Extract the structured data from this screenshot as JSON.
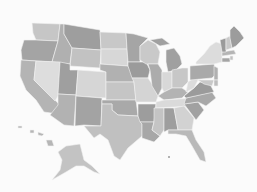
{
  "map": {
    "title": "",
    "type": "choropleth",
    "region": "United States",
    "colors": {
      "background": "#fbfbfb",
      "border": "#f2f2f2",
      "shade_light": "#d9d9d9",
      "shade_mid_light": "#c4c4c4",
      "shade_mid": "#b3b3b3",
      "shade_dark": "#9c9c9c"
    },
    "states": [
      {
        "id": "WA",
        "name": "Washington",
        "shade": "#c6c6c6",
        "d": "M32,23 L60,24 L58,41 L36,40 L33,33 Z"
      },
      {
        "id": "OR",
        "name": "Oregon",
        "shade": "#a4a4a4",
        "d": "M24,40 L36,40 L58,41 L56,48 L52,62 L22,60 L21,50 Z"
      },
      {
        "id": "CA",
        "name": "California",
        "shade": "#b4b4b4",
        "d": "M21,60 L36,61 L34,80 L60,105 L58,114 L44,112 L36,100 L26,90 L20,76 Z"
      },
      {
        "id": "ID",
        "name": "Idaho",
        "shade": "#b0b0b0",
        "d": "M60,24 L64,24 L64,34 L72,48 L70,64 L52,62 L56,48 L58,41 Z"
      },
      {
        "id": "NV",
        "name": "Nevada",
        "shade": "#dddddd",
        "d": "M36,61 L60,62 L58,96 L55,101 L34,80 Z"
      },
      {
        "id": "MT",
        "name": "Montana",
        "shade": "#9e9e9e",
        "d": "M64,24 L100,30 L101,50 L72,48 L64,34 Z"
      },
      {
        "id": "WY",
        "name": "Wyoming",
        "shade": "#c2c2c2",
        "d": "M72,48 L101,50 L100,68 L70,66 Z"
      },
      {
        "id": "UT",
        "name": "Utah",
        "shade": "#9f9f9f",
        "d": "M60,62 L70,64 L70,70 L78,70 L76,95 L58,94 Z"
      },
      {
        "id": "AZ",
        "name": "Arizona",
        "shade": "#b2b2b2",
        "d": "M58,94 L76,95 L74,126 L64,125 L50,115 L58,105 Z"
      },
      {
        "id": "CO",
        "name": "Colorado",
        "shade": "#d6d6d6",
        "d": "M78,70 L106,72 L106,98 L76,96 Z"
      },
      {
        "id": "NM",
        "name": "New Mexico",
        "shade": "#a3a3a3",
        "d": "M76,96 L102,98 L101,126 L84,125 L75,126 Z"
      },
      {
        "id": "ND",
        "name": "North Dakota",
        "shade": "#c8c8c8",
        "d": "M100,32 L126,33 L127,49 L101,49 Z"
      },
      {
        "id": "SD",
        "name": "South Dakota",
        "shade": "#d7d7d7",
        "d": "M101,49 L127,49 L128,66 L101,64 Z"
      },
      {
        "id": "NE",
        "name": "Nebraska",
        "shade": "#b1b1b1",
        "d": "M100,64 L128,66 L132,74 L134,82 L106,82 L106,72 L100,70 Z"
      },
      {
        "id": "KS",
        "name": "Kansas",
        "shade": "#c5c5c5",
        "d": "M106,82 L134,82 L136,100 L106,100 Z"
      },
      {
        "id": "OK",
        "name": "Oklahoma",
        "shade": "#a9a9a9",
        "d": "M102,100 L136,100 L138,116 L118,115 L112,110 L112,104 L102,104 Z"
      },
      {
        "id": "TX",
        "name": "Texas",
        "shade": "#c0c0c0",
        "d": "M102,104 L112,104 L112,110 L118,115 L138,116 L142,124 L142,136 L128,148 L120,160 L114,156 L108,140 L100,134 L94,138 L84,126 L101,126 Z"
      },
      {
        "id": "MN",
        "name": "Minnesota",
        "shade": "#a5a5a5",
        "d": "M126,33 L134,34 L148,38 L140,46 L140,62 L128,62 L127,49 Z"
      },
      {
        "id": "IA",
        "name": "Iowa",
        "shade": "#9b9b9b",
        "d": "M128,62 L146,62 L150,70 L148,78 L132,78 L128,66 Z"
      },
      {
        "id": "MO",
        "name": "Missouri",
        "shade": "#d4d4d4",
        "d": "M132,78 L148,78 L152,84 L158,96 L156,102 L136,102 L134,82 Z"
      },
      {
        "id": "AR",
        "name": "Arkansas",
        "shade": "#9d9d9d",
        "d": "M138,104 L156,104 L154,122 L140,122 L138,116 Z"
      },
      {
        "id": "LA",
        "name": "Louisiana",
        "shade": "#a7a7a7",
        "d": "M140,122 L154,122 L152,130 L160,136 L154,142 L142,138 L142,124 Z"
      },
      {
        "id": "WI",
        "name": "Wisconsin",
        "shade": "#c9c9c9",
        "d": "M140,46 L148,40 L156,44 L160,52 L158,64 L146,64 L140,60 Z"
      },
      {
        "id": "IL",
        "name": "Illinois",
        "shade": "#acacac",
        "d": "M148,64 L158,64 L162,70 L162,88 L158,96 L152,86 L150,70 Z"
      },
      {
        "id": "MI",
        "name": "Michigan",
        "shade": "#a0a0a0",
        "d": "M166,50 L174,48 L180,56 L182,64 L176,70 L168,72 L166,62 Z M150,40 L162,38 L170,44 L160,46 Z"
      },
      {
        "id": "IN",
        "name": "Indiana",
        "shade": "#d8d8d8",
        "d": "M162,72 L172,72 L172,88 L164,92 L162,88 Z"
      },
      {
        "id": "OH",
        "name": "Ohio",
        "shade": "#c7c7c7",
        "d": "M172,70 L182,68 L188,68 L188,82 L182,88 L172,88 Z"
      },
      {
        "id": "KY",
        "name": "Kentucky",
        "shade": "#b3b3b3",
        "d": "M158,96 L164,92 L172,88 L182,88 L188,92 L182,98 L164,100 Z"
      },
      {
        "id": "TN",
        "name": "Tennessee",
        "shade": "#dadada",
        "d": "M156,102 L164,100 L194,98 L192,106 L156,108 Z"
      },
      {
        "id": "MS",
        "name": "Mississippi",
        "shade": "#c4c4c4",
        "d": "M154,108 L164,108 L164,130 L160,136 L152,130 L154,122 Z"
      },
      {
        "id": "AL",
        "name": "Alabama",
        "shade": "#9e9e9e",
        "d": "M164,108 L174,108 L178,130 L168,130 L164,132 Z"
      },
      {
        "id": "GA",
        "name": "Georgia",
        "shade": "#d2d2d2",
        "d": "M174,108 L184,106 L194,118 L192,130 L178,130 Z"
      },
      {
        "id": "FL",
        "name": "Florida",
        "shade": "#b9b9b9",
        "d": "M168,130 L192,130 L196,140 L204,152 L206,162 L200,160 L192,146 L186,136 L176,134 L168,134 Z"
      },
      {
        "id": "SC",
        "name": "South Carolina",
        "shade": "#a1a1a1",
        "d": "M184,104 L198,102 L204,110 L196,120 Z"
      },
      {
        "id": "NC",
        "name": "North Carolina",
        "shade": "#a8a8a8",
        "d": "M186,98 L212,92 L216,98 L206,106 L198,102 L184,104 Z"
      },
      {
        "id": "VA",
        "name": "Virginia",
        "shade": "#9b9b9b",
        "d": "M184,96 L194,88 L200,82 L210,84 L214,92 L186,98 Z"
      },
      {
        "id": "WV",
        "name": "West Virginia",
        "shade": "#dcdcdc",
        "d": "M188,82 L194,78 L198,80 L194,88 L186,92 Z"
      },
      {
        "id": "PA",
        "name": "Pennsylvania",
        "shade": "#a9a9a9",
        "d": "M190,66 L214,64 L216,74 L212,78 L190,80 Z"
      },
      {
        "id": "NY",
        "name": "New York",
        "shade": "#dcdcdc",
        "d": "M196,62 L204,54 L210,46 L216,42 L222,44 L222,62 L214,64 L196,64 Z"
      },
      {
        "id": "NJ",
        "name": "New Jersey",
        "shade": "#b0b0b0",
        "d": "M214,66 L218,68 L218,80 L214,80 Z"
      },
      {
        "id": "MD",
        "name": "Maryland",
        "shade": "#c8c8c8",
        "d": "M198,80 L214,80 L212,86 L204,84 Z"
      },
      {
        "id": "DE",
        "name": "Delaware",
        "shade": "#bdbdbd",
        "d": "M214,80 L218,80 L218,86 L214,86 Z"
      },
      {
        "id": "CT",
        "name": "Connecticut",
        "shade": "#a5a5a5",
        "d": "M222,58 L230,58 L230,62 L222,62 Z"
      },
      {
        "id": "RI",
        "name": "Rhode Island",
        "shade": "#c0c0c0",
        "d": "M230,56 L233,56 L233,60 L230,60 Z"
      },
      {
        "id": "MA",
        "name": "Massachusetts",
        "shade": "#b5b5b5",
        "d": "M222,52 L234,50 L236,54 L222,56 Z"
      },
      {
        "id": "VT",
        "name": "Vermont",
        "shade": "#9a9a9a",
        "d": "M220,40 L226,38 L226,52 L222,52 Z"
      },
      {
        "id": "NH",
        "name": "New Hampshire",
        "shade": "#c9c9c9",
        "d": "M226,38 L230,36 L232,48 L226,50 Z"
      },
      {
        "id": "ME",
        "name": "Maine",
        "shade": "#9c9c9c",
        "d": "M230,30 L234,26 L240,32 L244,38 L236,46 L232,48 L230,38 Z"
      },
      {
        "id": "AK",
        "name": "Alaska",
        "shade": "#c3c3c3",
        "d": "M66,146 L80,144 L84,160 L92,166 L100,174 L94,172 L84,166 L76,166 L66,172 L52,180 L60,170 L62,160 L58,152 Z"
      },
      {
        "id": "HI",
        "name": "Hawaii",
        "shade": "#b6b6b6",
        "d": "M18,126 L22,126 L22,128 L18,128 Z M30,130 L34,130 L34,133 L30,133 Z M38,132 L44,134 L42,136 L38,135 Z M46,140 L52,140 L54,146 L48,146 Z"
      }
    ],
    "markers": [
      {
        "name": "dot",
        "cx": 169,
        "cy": 157,
        "r": 0.8
      }
    ]
  }
}
